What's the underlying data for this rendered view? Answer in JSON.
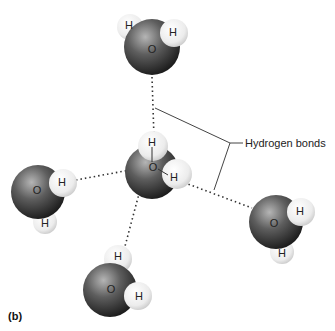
{
  "figure": {
    "panel_label": "(b)",
    "callout_label": "Hydrogen bonds"
  },
  "molecules": [
    {
      "id": "top",
      "oxygen": "O",
      "hydrogens": [
        "H",
        "H"
      ]
    },
    {
      "id": "center",
      "oxygen": "O",
      "hydrogens": [
        "H",
        "H"
      ]
    },
    {
      "id": "left",
      "oxygen": "O",
      "hydrogens": [
        "H",
        "H"
      ]
    },
    {
      "id": "bottom",
      "oxygen": "O",
      "hydrogens": [
        "H",
        "H"
      ]
    },
    {
      "id": "right",
      "oxygen": "O",
      "hydrogens": [
        "H",
        "H"
      ]
    }
  ],
  "colors": {
    "oxygen_dark": "#2a2a2a",
    "oxygen_light": "#9a9a9a",
    "hydrogen": "#f2f2f2",
    "bond_line": "#333333"
  }
}
